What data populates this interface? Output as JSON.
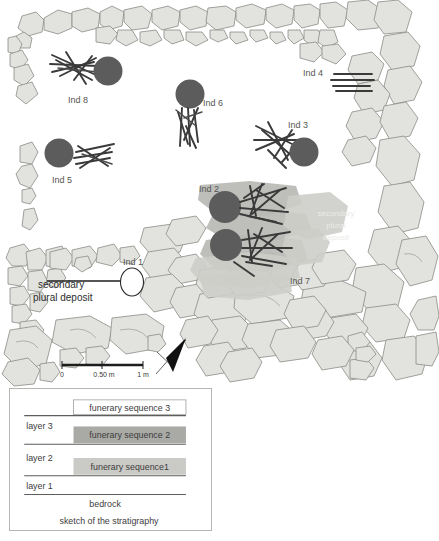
{
  "plan": {
    "individuals": [
      {
        "id": "ind-8",
        "label": "Ind 8",
        "label_x": 45,
        "label_y": 99,
        "skull_cx": 108,
        "skull_cy": 71,
        "skull_r": 14.5,
        "type": "skull-and-bones"
      },
      {
        "id": "ind-6",
        "label": "Ind 6",
        "label_x": 203,
        "label_y": 106,
        "skull_cx": 190,
        "skull_cy": 94,
        "skull_r": 14.5,
        "type": "skull-and-bones"
      },
      {
        "id": "ind-4",
        "label": "Ind 4",
        "label_x": 303,
        "label_y": 76,
        "skull_cx": null,
        "skull_cy": null,
        "skull_r": 0,
        "type": "bones-only"
      },
      {
        "id": "ind-3",
        "label": "Ind 3",
        "label_x": 288,
        "label_y": 128,
        "skull_cx": 304,
        "skull_cy": 152,
        "skull_r": 14.5,
        "type": "skull-and-bones"
      },
      {
        "id": "ind-5",
        "label": "Ind 5",
        "label_x": 52,
        "label_y": 181,
        "skull_cx": 59,
        "skull_cy": 153,
        "skull_r": 14.5,
        "type": "skull-and-bones"
      },
      {
        "id": "ind-2",
        "label": "Ind 2",
        "label_x": 199,
        "label_y": 192,
        "skull_cx": 225,
        "skull_cy": 207,
        "skull_r": 16,
        "type": "skull-and-bones"
      },
      {
        "id": "ind-7",
        "label": "Ind 7",
        "label_x": 290,
        "label_y": 284,
        "skull_cx": 226,
        "skull_cy": 245,
        "skull_r": 16,
        "type": "skull-and-bones"
      },
      {
        "id": "ind-1",
        "label": "Ind 1",
        "label_x": 123,
        "label_y": 265,
        "skull_cx": 132,
        "skull_cy": 282,
        "skull_r": 11,
        "type": "open-ellipse"
      }
    ],
    "annotations": [
      {
        "id": "secondary-plural-deposit-left",
        "lines": [
          "secondary",
          "plural deposit"
        ],
        "x": 38,
        "y": 284,
        "style": "dark"
      },
      {
        "id": "secondary-plural-deposit-right",
        "lines": [
          "secondary",
          "plural",
          "deposit"
        ],
        "x": 336,
        "y": 216,
        "style": "faint"
      }
    ],
    "scale_bar": {
      "ticks": [
        "0",
        "0.50 m",
        "1 m"
      ],
      "x_start": 62,
      "x_end": 143,
      "y": 365
    },
    "north_arrow": {
      "name": "north-arrow"
    }
  },
  "stratigraphy": {
    "caption": "sketch of the stratigraphy",
    "bedrock_label": "bedrock",
    "layers": [
      {
        "id": "layer-3",
        "label": "layer 3"
      },
      {
        "id": "layer-2",
        "label": "layer 2"
      },
      {
        "id": "layer-1",
        "label": "layer 1"
      }
    ],
    "sequences": [
      {
        "id": "funerary-sequence-3",
        "label": "funerary sequence 3",
        "fill": "#ffffff"
      },
      {
        "id": "funerary-sequence-2",
        "label": "funerary sequence 2",
        "fill": "#a9a9a5"
      },
      {
        "id": "funerary-sequence-1",
        "label": "funerary sequence1",
        "fill": "#cacac6"
      }
    ]
  },
  "colors": {
    "stone_fill": "#e2e2de",
    "stone_stroke": "#8a8a86",
    "skull": "#5c5c5c",
    "bone": "#3a3a3a",
    "deposit": "#b9b9b5",
    "background": "#ffffff"
  }
}
